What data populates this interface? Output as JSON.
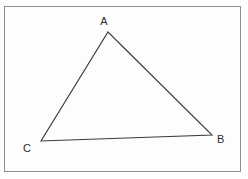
{
  "figure": {
    "kind": "geometry-diagram",
    "shape": "triangle",
    "canvas": {
      "width": 248,
      "height": 179,
      "background_color": "#fdfdfd"
    },
    "frame": {
      "name": "figure-border",
      "x": 4.5,
      "y": 6.5,
      "width": 236,
      "height": 165,
      "stroke_color": "#8d8d8d",
      "stroke_width": 1.2,
      "fill": "none"
    },
    "triangle": {
      "stroke_color": "#3a3a3a",
      "stroke_width": 1.1,
      "fill": "none",
      "points": "108,32 212,135 41,141",
      "vertices": [
        {
          "id": "A",
          "x": 108,
          "y": 32
        },
        {
          "id": "B",
          "x": 212,
          "y": 135
        },
        {
          "id": "C",
          "x": 41,
          "y": 141
        }
      ],
      "edges": [
        {
          "id": "AB",
          "from": "A",
          "to": "B"
        },
        {
          "id": "BC",
          "from": "B",
          "to": "C"
        },
        {
          "id": "CA",
          "from": "C",
          "to": "A"
        }
      ]
    },
    "labels": [
      {
        "id": "label-a",
        "text": "A",
        "x": 104,
        "y": 25,
        "anchor": "middle"
      },
      {
        "id": "label-b",
        "text": "B",
        "x": 217,
        "y": 143,
        "anchor": "start"
      },
      {
        "id": "label-c",
        "text": "C",
        "x": 31,
        "y": 152,
        "anchor": "end"
      }
    ]
  }
}
